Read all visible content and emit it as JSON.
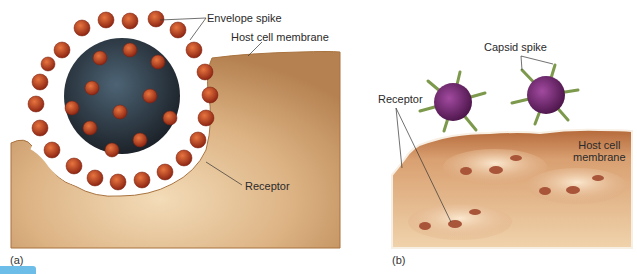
{
  "figure": {
    "panels": [
      {
        "id": "a",
        "label": "(a)",
        "labels": {
          "envelope_spike": "Envelope spike",
          "host_cell_membrane": "Host cell membrane",
          "receptor": "Receptor"
        }
      },
      {
        "id": "b",
        "label": "(b)",
        "labels": {
          "capsid_spike": "Capsid spike",
          "receptor": "Receptor",
          "host_cell_membrane_line1": "Host cell",
          "host_cell_membrane_line2": "membrane"
        }
      }
    ],
    "colors": {
      "membrane": "#c99a63",
      "membrane_edge": "#a9733f",
      "envelope_spike": "#b8401e",
      "virus_core": "#2f3a45",
      "capsid": "#7a2c78",
      "capsid_spike": "#7d9a4c",
      "tab": "#6cbde8"
    }
  }
}
